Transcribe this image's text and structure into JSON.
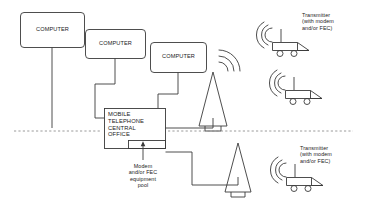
{
  "diagram": {
    "stroke_color": "#3a3a3a",
    "text_color": "#1b1b1b",
    "background": "#ffffff",
    "computers": [
      {
        "label": "COMPUTER"
      },
      {
        "label": "COMPUTER"
      },
      {
        "label": "COMPUTER"
      }
    ],
    "central_office": {
      "label": "MOBILE\nTELEPHONE\nCENTRAL\nOFFICE"
    },
    "modem_pool": {
      "caption": "Modem\nand/or FEC\nequipment\npool"
    },
    "towers": [
      {
        "name": "upper-tower"
      },
      {
        "name": "lower-tower"
      }
    ],
    "transmitters": [
      {
        "label": "Transmitter\n(with modem\nand/or FEC)"
      },
      {
        "label": ""
      },
      {
        "label": "Transmitter\n(with modem\nand/or FEC)"
      }
    ],
    "divider": {
      "name": "dashed-boundary-line"
    }
  }
}
